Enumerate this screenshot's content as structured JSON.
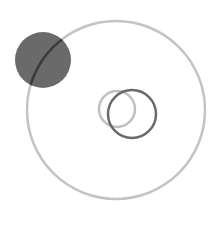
{
  "canvas": {
    "width": 219,
    "height": 242,
    "background": "#ffffff"
  },
  "shapes": [
    {
      "id": "large-ring",
      "cx": 116,
      "cy": 110,
      "r": 89,
      "stroke": "#c4c4c4",
      "fill": "none",
      "stroke_width": 2.5
    },
    {
      "id": "filled-dot",
      "cx": 43,
      "cy": 60,
      "r": 28,
      "fill": "#6a6a6a"
    },
    {
      "id": "large-ring-overlap-arc",
      "stroke": "#3a3a3a"
    },
    {
      "id": "small-light-ring",
      "cx": 117,
      "cy": 109,
      "r": 18,
      "stroke": "#c0c0c0",
      "fill": "none",
      "stroke_width": 2.5
    },
    {
      "id": "small-dark-ring",
      "cx": 132,
      "cy": 114,
      "r": 24,
      "stroke": "#6a6a6a",
      "fill": "none",
      "stroke_width": 2.5
    }
  ]
}
